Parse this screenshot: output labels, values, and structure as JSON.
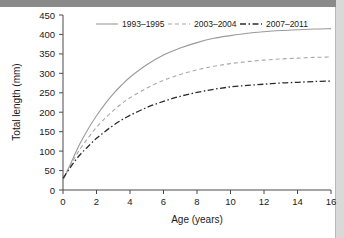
{
  "chart_data": {
    "type": "line",
    "title": "",
    "xlabel": "Age (years)",
    "ylabel": "Total length (mm)",
    "xlim": [
      0,
      16
    ],
    "ylim": [
      0,
      450
    ],
    "xticks": [
      0,
      2,
      4,
      6,
      8,
      10,
      12,
      14,
      16
    ],
    "yticks": [
      0,
      50,
      100,
      150,
      200,
      250,
      300,
      350,
      400,
      450
    ],
    "grid": false,
    "legend_position": "top",
    "x": [
      0,
      0.5,
      1,
      1.5,
      2,
      2.5,
      3,
      3.5,
      4,
      5,
      6,
      7,
      8,
      9,
      10,
      11,
      12,
      13,
      14,
      15,
      16
    ],
    "series": [
      {
        "name": "1993–1995",
        "style": "solid",
        "color": "#9a9a9a",
        "asymptote": 415,
        "values": [
          25,
          72,
          118,
          157,
          191,
          221,
          247,
          270,
          290,
          322,
          347,
          365,
          379,
          390,
          397,
          403,
          407,
          410,
          412,
          414,
          415
        ]
      },
      {
        "name": "2003–2004",
        "style": "dashed",
        "color": "#a8a8a8",
        "asymptote": 342,
        "values": [
          28,
          68,
          104,
          134,
          161,
          184,
          204,
          222,
          237,
          262,
          282,
          297,
          309,
          318,
          325,
          330,
          334,
          337,
          339,
          341,
          342
        ]
      },
      {
        "name": "2007–2011",
        "style": "dash-dot",
        "color": "#2b2b2b",
        "asymptote": 280,
        "values": [
          30,
          62,
          90,
          112,
          133,
          150,
          166,
          180,
          192,
          212,
          228,
          241,
          251,
          259,
          265,
          269,
          272,
          275,
          277,
          279,
          280
        ]
      }
    ]
  },
  "axes": {
    "ylabel": "Total length (mm)",
    "xlabel": "Age (years)",
    "ytick_labels": [
      "450",
      "400",
      "350",
      "300",
      "250",
      "200",
      "150",
      "100",
      "50",
      "0"
    ],
    "xtick_labels": [
      "0",
      "2",
      "4",
      "6",
      "8",
      "10",
      "12",
      "14",
      "16"
    ]
  },
  "legend": {
    "items": [
      {
        "label": "1993–1995"
      },
      {
        "label": "2003–2004"
      },
      {
        "label": "2007–2011"
      }
    ]
  },
  "colors": {
    "series_1": "#9a9a9a",
    "series_2": "#a8a8a8",
    "series_3": "#2b2b2b",
    "axis": "#4a4a4a",
    "text": "#1a1a1a",
    "top_band": "#8a8a8a",
    "right_band": "#d9d9d9"
  }
}
